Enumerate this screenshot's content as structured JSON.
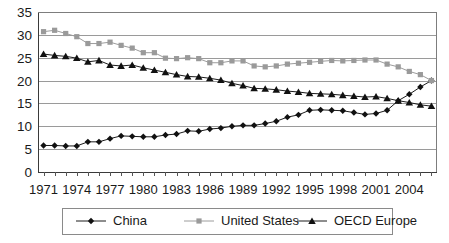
{
  "chart_data": {
    "type": "line",
    "title": "",
    "subtitle": "",
    "xlabel": "",
    "ylabel": "",
    "xlim": [
      1971,
      2006
    ],
    "ylim": [
      0,
      35
    ],
    "ytick_labels": [
      "35",
      "30",
      "25",
      "20",
      "15",
      "10",
      "5",
      "0"
    ],
    "ytick_values": [
      35,
      30,
      25,
      20,
      15,
      10,
      5,
      0
    ],
    "xtick_labels": [
      "1971",
      "1974",
      "1977",
      "1980",
      "1983",
      "1986",
      "1989",
      "1992",
      "1995",
      "1998",
      "2001",
      "2004"
    ],
    "xtick_values": [
      1971,
      1974,
      1977,
      1980,
      1983,
      1986,
      1989,
      1992,
      1995,
      1998,
      2001,
      2004
    ],
    "grid": true,
    "grid_axis": "y",
    "legend_position": "bottom",
    "x": [
      1971,
      1972,
      1973,
      1974,
      1975,
      1976,
      1977,
      1978,
      1979,
      1980,
      1981,
      1982,
      1983,
      1984,
      1985,
      1986,
      1987,
      1988,
      1989,
      1990,
      1991,
      1992,
      1993,
      1994,
      1995,
      1996,
      1997,
      1998,
      1999,
      2000,
      2001,
      2002,
      2003,
      2004,
      2005,
      2006
    ],
    "series": [
      {
        "name": "China",
        "marker": "diamond",
        "color": "#111111",
        "line_color": "#1c1c1c",
        "values": [
          5.8,
          5.8,
          5.7,
          5.7,
          6.6,
          6.6,
          7.3,
          7.9,
          7.8,
          7.7,
          7.7,
          8.1,
          8.3,
          9.0,
          8.9,
          9.4,
          9.6,
          10.0,
          10.2,
          10.2,
          10.6,
          11.1,
          12.0,
          12.5,
          13.5,
          13.6,
          13.5,
          13.4,
          13.0,
          12.6,
          12.8,
          13.5,
          15.6,
          17.0,
          18.6,
          20.0
        ]
      },
      {
        "name": "United States",
        "marker": "square",
        "color": "#9a9a9a",
        "line_color": "#9c9c9c",
        "values": [
          30.7,
          31.0,
          30.3,
          29.6,
          28.1,
          28.1,
          28.4,
          27.7,
          27.1,
          26.1,
          26.1,
          24.9,
          24.8,
          25.0,
          24.8,
          23.9,
          23.9,
          24.3,
          24.3,
          23.2,
          23.0,
          23.2,
          23.6,
          23.8,
          24.0,
          24.2,
          24.4,
          24.3,
          24.4,
          24.5,
          24.5,
          23.6,
          23.0,
          22.0,
          21.3,
          20.0
        ]
      },
      {
        "name": "OECD Europe",
        "marker": "triangle",
        "color": "#111111",
        "line_color": "#1c1c1c",
        "values": [
          25.8,
          25.5,
          25.3,
          24.9,
          24.1,
          24.4,
          23.4,
          23.2,
          23.4,
          22.8,
          22.3,
          21.8,
          21.3,
          20.9,
          20.8,
          20.5,
          20.1,
          19.4,
          18.9,
          18.3,
          18.2,
          18.0,
          17.7,
          17.5,
          17.2,
          17.1,
          17.0,
          16.8,
          16.6,
          16.4,
          16.5,
          16.1,
          15.6,
          15.2,
          14.7,
          14.4
        ]
      }
    ]
  },
  "legend": {
    "items": [
      {
        "label": "China",
        "marker": "diamond"
      },
      {
        "label": "United States",
        "marker": "square"
      },
      {
        "label": "OECD Europe",
        "marker": "triangle"
      }
    ]
  }
}
